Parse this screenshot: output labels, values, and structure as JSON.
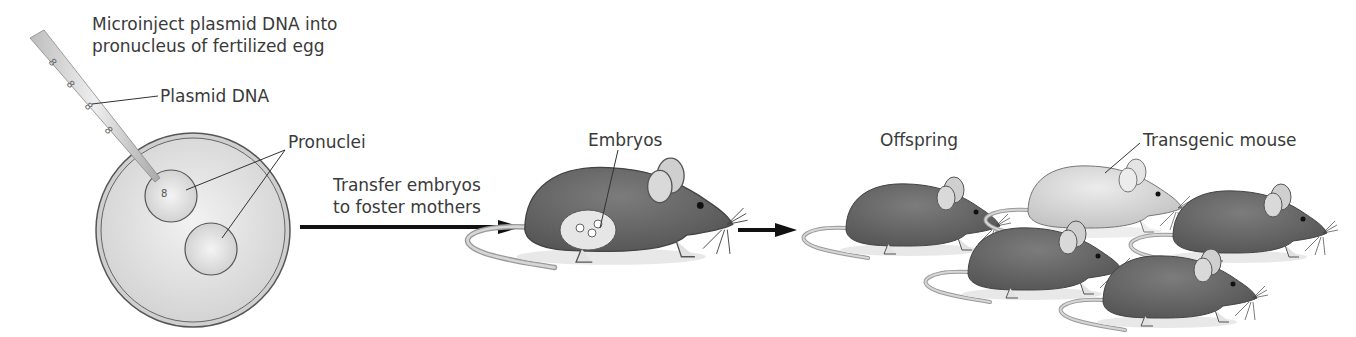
{
  "diagram": {
    "steps": [
      {
        "id": "microinjection",
        "label_line1": "Microinject plasmid DNA into",
        "label_line2": "pronucleus of fertilized egg"
      },
      {
        "id": "transfer",
        "label_line1": "Transfer embryos",
        "label_line2": "to foster mothers"
      },
      {
        "id": "offspring",
        "label": "Offspring"
      }
    ],
    "callouts": {
      "plasmid": "Plasmid DNA",
      "pronuclei": "Pronuclei",
      "embryos": "Embryos",
      "transgenic": "Transgenic mouse"
    },
    "elements": {
      "egg": "fertilized-egg",
      "pipette": "micropipette",
      "foster_mother": "foster-mother-mouse",
      "offspring_count": 5,
      "transgenic_count": 1
    },
    "colors": {
      "mouse_dark": "#6e6e6e",
      "mouse_light": "#d8d8d8",
      "egg_fill": "#e6e6e6",
      "arrow": "#111111"
    }
  }
}
